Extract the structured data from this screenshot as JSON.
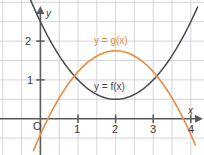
{
  "figure": {
    "type": "math-graph",
    "background": "#ffffff",
    "grid_color": "#c9ccd6",
    "axis_color": "#5a5a5a"
  },
  "axes": {
    "x_label": "x",
    "y_label": "y",
    "origin_label": "O",
    "x_ticks": [
      "1",
      "2",
      "3",
      "4"
    ],
    "y_ticks": [
      "1",
      "2"
    ],
    "x_range": [
      -0.95,
      4.3
    ],
    "y_range": [
      -0.9,
      3.05
    ],
    "grid_step": 0.5
  },
  "curves": [
    {
      "name": "f",
      "label": "y = f(x)",
      "color": "#4a4a4a",
      "label_color": "#4a4a4a",
      "shape": "parabola-up",
      "vertex": [
        2,
        0.5
      ],
      "a": 0.5
    },
    {
      "name": "g",
      "label": "y = g(x)",
      "color": "#ec8b3c",
      "label_color": "#e8883a",
      "shape": "parabola-down",
      "vertex": [
        2,
        1.75
      ],
      "a": -0.54
    }
  ],
  "chart_data": {
    "type": "line",
    "title": "",
    "xlabel": "x",
    "ylabel": "y",
    "xlim": [
      -0.95,
      4.3
    ],
    "ylim": [
      -0.9,
      3.05
    ],
    "grid": true,
    "legend": "inline-annotations",
    "series": [
      {
        "name": "y = f(x)",
        "color": "#4a4a4a",
        "equation": "f(x) = 0.5(x - 2)^2 + 0.5",
        "x": [
          -0.9,
          -0.5,
          0,
          0.5,
          1,
          1.5,
          2,
          2.5,
          3,
          3.5,
          4,
          4.3
        ],
        "values": [
          4.7,
          3.63,
          2.5,
          1.63,
          1.0,
          0.63,
          0.5,
          0.63,
          1.0,
          1.63,
          2.5,
          3.15
        ]
      },
      {
        "name": "y = g(x)",
        "color": "#ec8b3c",
        "equation": "g(x) = -0.54(x - 2)^2 + 1.75",
        "x": [
          0,
          0.2,
          0.5,
          1,
          1.5,
          2,
          2.5,
          3,
          3.5,
          3.8,
          4.1
        ],
        "values": [
          -0.41,
          0.0,
          0.53,
          1.21,
          1.61,
          1.75,
          1.61,
          1.21,
          0.53,
          0.0,
          -0.54
        ]
      }
    ],
    "annotations": [
      {
        "text": "y = g(x)",
        "x": 2.0,
        "y": 2.25,
        "color": "#e8883a"
      },
      {
        "text": "y = f(x)",
        "x": 2.0,
        "y": 1.0,
        "color": "#4a4a4a"
      }
    ]
  },
  "labels": {
    "g_curve": "y = g(x)",
    "f_curve": "y = f(x)",
    "origin": "O",
    "x_axis": "x",
    "y_axis": "y",
    "x1": "1",
    "x2": "2",
    "x3": "3",
    "x4": "4",
    "y1": "1",
    "y2": "2"
  }
}
